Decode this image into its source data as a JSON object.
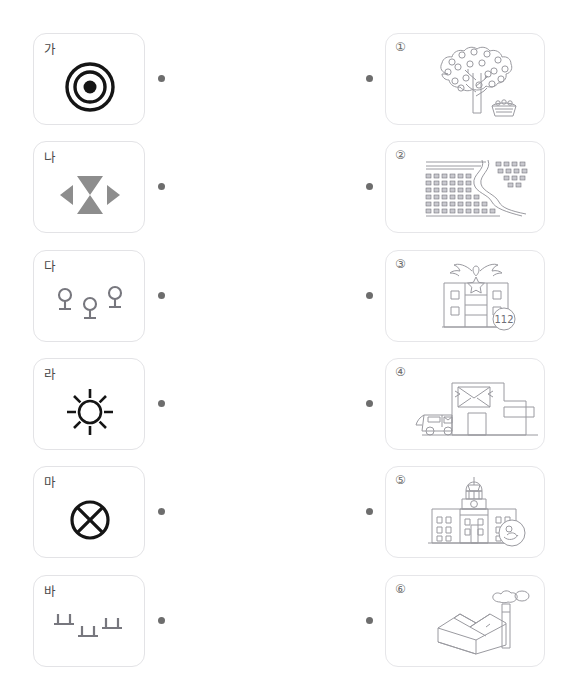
{
  "worksheet": {
    "header_fragment": "",
    "instruction_visible": false,
    "task_type": "matching"
  },
  "symbols": [
    {
      "label": "가",
      "icon": "concentric-circles-bullseye-icon",
      "meaning": "시청/군청",
      "dot_left": "connector-dot",
      "dot_right": "connector-dot"
    },
    {
      "label": "나",
      "icon": "factory-bowtie-icon",
      "meaning": "공장",
      "dot_left": "connector-dot",
      "dot_right": "connector-dot"
    },
    {
      "label": "다",
      "icon": "orchard-lollipop-trees-icon",
      "meaning": "과수원",
      "dot_left": "connector-dot",
      "dot_right": "connector-dot"
    },
    {
      "label": "라",
      "icon": "sunburst-school-icon",
      "meaning": "학교",
      "dot_left": "connector-dot",
      "dot_right": "connector-dot"
    },
    {
      "label": "마",
      "icon": "circle-x-post-office-icon",
      "meaning": "우체국",
      "dot_left": "connector-dot",
      "dot_right": "connector-dot"
    },
    {
      "label": "바",
      "icon": "rice-paddy-field-icon",
      "meaning": "논",
      "dot_left": "connector-dot",
      "dot_right": "connector-dot"
    }
  ],
  "pictures": [
    {
      "number": "①",
      "art": "fruit-tree-with-basket-illustration",
      "depicts": "orchard"
    },
    {
      "number": "②",
      "art": "rice-paddy-rows-with-stream-illustration",
      "depicts": "rice field"
    },
    {
      "number": "③",
      "art": "police-station-building-illustration",
      "depicts": "police station",
      "sign_text": "112"
    },
    {
      "number": "④",
      "art": "post-office-with-truck-illustration",
      "depicts": "post office"
    },
    {
      "number": "⑤",
      "art": "city-hall-domed-building-illustration",
      "depicts": "city hall"
    },
    {
      "number": "⑥",
      "art": "factory-with-chimney-illustration",
      "depicts": "factory"
    }
  ],
  "colors": {
    "card_border": "#e3e3e6",
    "dot": "#6d6d6d",
    "symbol_gray": "#8a8a8a",
    "symbol_black": "#1a1a1a",
    "line_art": "#9a9aa0",
    "label_text": "#4a4a4a"
  }
}
